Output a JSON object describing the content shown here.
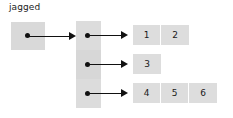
{
  "diagram": {
    "title_label": "jagged",
    "root": {
      "name": "root-reference-box",
      "dot": "reference-dot"
    },
    "spine": {
      "name": "jagged-array-spine",
      "slots": [
        {
          "index": 0,
          "dot": "reference-dot"
        },
        {
          "index": 1,
          "dot": "reference-dot"
        },
        {
          "index": 2,
          "dot": "reference-dot"
        }
      ]
    },
    "rows": [
      {
        "index": 0,
        "cells": [
          "1",
          "2"
        ]
      },
      {
        "index": 1,
        "cells": [
          "3"
        ]
      },
      {
        "index": 2,
        "cells": [
          "4",
          "5",
          "6"
        ]
      }
    ],
    "arrows": [
      {
        "name": "arrow-root-to-spine"
      },
      {
        "name": "arrow-spine0-to-row0"
      },
      {
        "name": "arrow-spine1-to-row1"
      },
      {
        "name": "arrow-spine2-to-row2"
      }
    ],
    "colors": {
      "cell_fill": "#d9d9d9",
      "cell_fill_light": "#dddddd",
      "ink": "#111111",
      "text": "#1a1a1a",
      "background": "#ffffff"
    }
  }
}
